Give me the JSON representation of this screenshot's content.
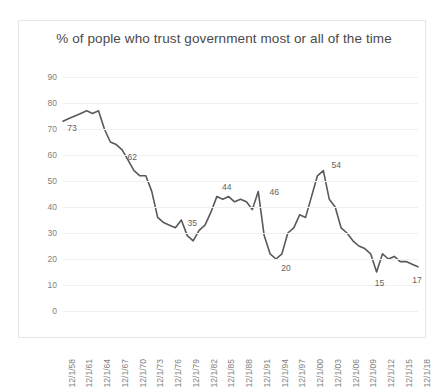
{
  "chart_data": {
    "type": "line",
    "title": "% of pople who trust government most or all of the time",
    "xlabel": "",
    "ylabel": "",
    "ylim": [
      0,
      90
    ],
    "yticks": [
      0,
      10,
      20,
      30,
      40,
      50,
      60,
      70,
      80,
      90
    ],
    "grid": true,
    "legend": "none",
    "line_color": "#595959",
    "xticklabels": [
      "12/1/58",
      "12/1/61",
      "12/1/64",
      "12/1/67",
      "12/1/70",
      "12/1/73",
      "12/1/76",
      "12/1/79",
      "12/1/82",
      "12/1/85",
      "12/1/88",
      "12/1/91",
      "12/1/94",
      "12/1/97",
      "12/1/00",
      "12/1/03",
      "12/1/06",
      "12/1/09",
      "12/1/12",
      "12/1/15",
      "12/1/18"
    ],
    "xrange": [
      "12/1/58",
      "12/1/18"
    ],
    "annotations": [
      {
        "label": "73",
        "x": 1958,
        "y": 73
      },
      {
        "label": "62",
        "x": 1968,
        "y": 62
      },
      {
        "label": "35",
        "x": 1978,
        "y": 35
      },
      {
        "label": "44",
        "x": 1986,
        "y": 44
      },
      {
        "label": "46",
        "x": 1991,
        "y": 46
      },
      {
        "label": "20",
        "x": 1994,
        "y": 20
      },
      {
        "label": "54",
        "x": 2002,
        "y": 54
      },
      {
        "label": "15",
        "x": 2011,
        "y": 15
      },
      {
        "label": "17",
        "x": 2018,
        "y": 17
      }
    ],
    "x": [
      1958,
      1959,
      1960,
      1961,
      1962,
      1963,
      1964,
      1965,
      1966,
      1967,
      1968,
      1969,
      1970,
      1971,
      1972,
      1973,
      1974,
      1975,
      1976,
      1977,
      1978,
      1979,
      1980,
      1981,
      1982,
      1983,
      1984,
      1985,
      1986,
      1987,
      1988,
      1989,
      1990,
      1991,
      1992,
      1993,
      1994,
      1995,
      1996,
      1997,
      1998,
      1999,
      2000,
      2001,
      2002,
      2003,
      2004,
      2005,
      2006,
      2007,
      2008,
      2009,
      2010,
      2011,
      2012,
      2013,
      2014,
      2015,
      2016,
      2017,
      2018
    ],
    "values": [
      73,
      74,
      75,
      76,
      77,
      76,
      77,
      70,
      65,
      64,
      62,
      58,
      54,
      52,
      52,
      46,
      36,
      34,
      33,
      32,
      35,
      29,
      27,
      31,
      33,
      38,
      44,
      43,
      44,
      42,
      43,
      42,
      39,
      46,
      29,
      22,
      20,
      22,
      30,
      32,
      37,
      36,
      44,
      52,
      54,
      43,
      40,
      32,
      30,
      27,
      25,
      24,
      22,
      15,
      22,
      20,
      21,
      19,
      19,
      18,
      17
    ]
  }
}
